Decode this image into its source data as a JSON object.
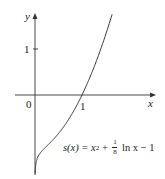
{
  "chart_data": {
    "type": "line",
    "title": "",
    "xlabel": "x",
    "ylabel": "y",
    "origin_label": "0",
    "x_ticks": [
      {
        "value": 1,
        "label": "1"
      }
    ],
    "y_ticks": [
      {
        "value": 1,
        "label": "1"
      }
    ],
    "xlim": [
      -0.4,
      2.6
    ],
    "ylim": [
      -1.7,
      1.8
    ],
    "grid": false,
    "legend": null,
    "series": [
      {
        "name": "s(x) = x^2 + (1/8) ln x - 1",
        "function": "x^2 + (1/8)*ln(x) - 1",
        "x": [
          0.01,
          0.05,
          0.1,
          0.2,
          0.3,
          0.4,
          0.5,
          0.6,
          0.7,
          0.8,
          0.9,
          1.0,
          1.1,
          1.2,
          1.3,
          1.4,
          1.5,
          1.6
        ],
        "values": [
          -1.576,
          -1.372,
          -1.278,
          -1.161,
          -1.06,
          -0.955,
          -0.837,
          -0.704,
          -0.555,
          -0.388,
          -0.203,
          0.0,
          0.222,
          0.463,
          0.723,
          1.002,
          1.301,
          1.619
        ]
      }
    ],
    "annotations": [
      {
        "text": "s(x) = x² + ⅛ ln x − 1",
        "position": "lower right of curve"
      }
    ]
  },
  "labels": {
    "y_axis": "y",
    "x_axis": "x",
    "origin": "0",
    "x_tick_1": "1",
    "y_tick_1": "1",
    "formula": {
      "lhs": "s(x) = x",
      "exp": "2",
      "plus": " + ",
      "frac_num": "1",
      "frac_den": "8",
      "rest": " ln x − 1"
    }
  },
  "colors": {
    "axis": "#333333",
    "curve": "#333333",
    "text": "#222222",
    "background": "#ffffff"
  }
}
